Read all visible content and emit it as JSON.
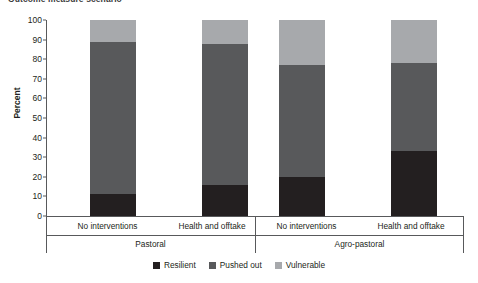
{
  "chart_data": {
    "type": "bar",
    "subtype": "stacked-bar-100-percent",
    "title": "Outcome measure scenario",
    "xlabel": "",
    "ylabel": "Percent",
    "ylim": [
      0,
      100
    ],
    "yticks": [
      0,
      10,
      20,
      30,
      40,
      50,
      60,
      70,
      80,
      90,
      100
    ],
    "grid": false,
    "legend_position": "bottom-center",
    "groups": [
      "Pastoral",
      "Agro-pastoral"
    ],
    "categories": [
      "No interventions",
      "Health and offtake",
      "No interventions",
      "Health and offtake"
    ],
    "series": [
      {
        "name": "Resilient",
        "color": "#231f20",
        "values": [
          11,
          16,
          20,
          33
        ]
      },
      {
        "name": "Pushed out",
        "color": "#58595b",
        "values": [
          78,
          72,
          57,
          45
        ]
      },
      {
        "name": "Vulnerable",
        "color": "#a7a9ac",
        "values": [
          11,
          12,
          23,
          22
        ]
      }
    ]
  },
  "axis": {
    "y_label": "Percent",
    "tick_labels": [
      "0",
      "10",
      "20",
      "30",
      "40",
      "50",
      "60",
      "70",
      "80",
      "90",
      "100"
    ]
  },
  "legend": {
    "items": [
      {
        "label": "Resilient",
        "color": "#231f20"
      },
      {
        "label": "Pushed out",
        "color": "#58595b"
      },
      {
        "label": "Vulnerable",
        "color": "#a7a9ac"
      }
    ]
  }
}
